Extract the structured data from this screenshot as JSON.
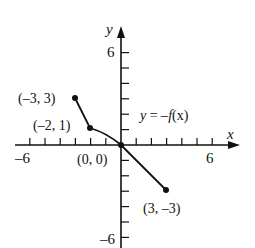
{
  "chart_data": {
    "type": "line",
    "title": "",
    "xlabel": "x",
    "ylabel": "y",
    "xlim": [
      -6,
      6
    ],
    "ylim": [
      -6,
      6
    ],
    "grid": false,
    "x_tick_labels": [
      "-6",
      "6"
    ],
    "y_tick_labels": [
      "6",
      "-6"
    ],
    "series": [
      {
        "name": "y = -f(x)",
        "points": [
          {
            "x": -3,
            "y": 3
          },
          {
            "x": -2,
            "y": 1
          },
          {
            "x": 0,
            "y": 0
          },
          {
            "x": 3,
            "y": -3
          }
        ]
      }
    ],
    "annotations": [
      {
        "text": "(–3, 3)",
        "x": -3,
        "y": 3
      },
      {
        "text": "(–2, 1)",
        "x": -2,
        "y": 1
      },
      {
        "text": "(0, 0)",
        "x": 0,
        "y": 0
      },
      {
        "text": "(3, –3)",
        "x": 3,
        "y": -3
      },
      {
        "text": "y = –f(x)",
        "x": 1.2,
        "y": 1
      }
    ]
  },
  "labels": {
    "x_axis": "x",
    "y_axis": "y",
    "x_min": "–6",
    "x_max": "6",
    "y_max": "6",
    "y_min": "–6",
    "curve_label_prefix": "y",
    "curve_label_eq": " = –",
    "curve_label_f": "f",
    "curve_label_arg": "(x)",
    "pt_a": "(–3, 3)",
    "pt_b": "(–2, 1)",
    "pt_origin": "(0, 0)",
    "pt_d": "(3, –3)"
  }
}
